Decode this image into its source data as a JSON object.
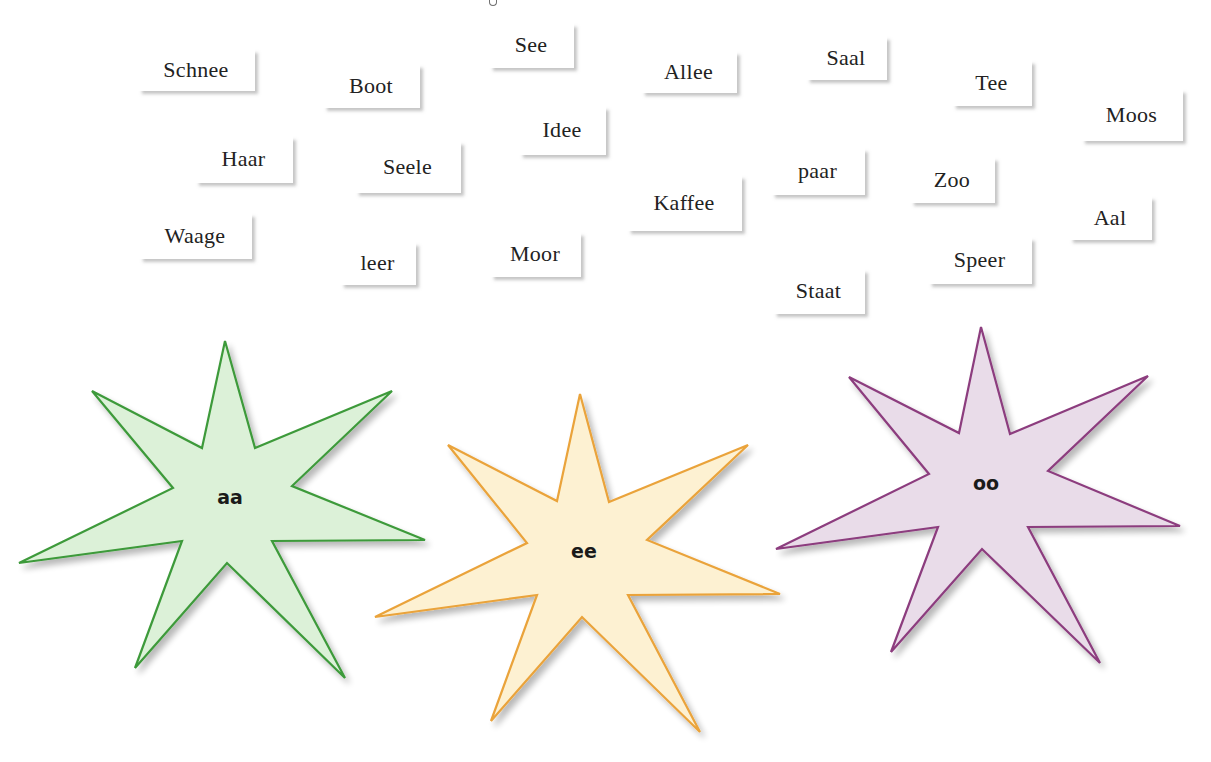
{
  "exercise": {
    "instruction_visible": false
  },
  "word_cards": [
    {
      "word": "Schnee",
      "x": 137,
      "y": 48,
      "w": 118,
      "h": 43
    },
    {
      "word": "Boot",
      "x": 322,
      "y": 63,
      "w": 98,
      "h": 45
    },
    {
      "word": "See",
      "x": 488,
      "y": 22,
      "w": 86,
      "h": 46
    },
    {
      "word": "Allee",
      "x": 640,
      "y": 50,
      "w": 97,
      "h": 43
    },
    {
      "word": "Saal",
      "x": 805,
      "y": 35,
      "w": 82,
      "h": 45
    },
    {
      "word": "Tee",
      "x": 951,
      "y": 59,
      "w": 81,
      "h": 47
    },
    {
      "word": "Moos",
      "x": 1080,
      "y": 88,
      "w": 103,
      "h": 53
    },
    {
      "word": "Haar",
      "x": 194,
      "y": 135,
      "w": 99,
      "h": 48
    },
    {
      "word": "Seele",
      "x": 354,
      "y": 140,
      "w": 107,
      "h": 53
    },
    {
      "word": "Idee",
      "x": 518,
      "y": 105,
      "w": 88,
      "h": 50
    },
    {
      "word": "paar",
      "x": 770,
      "y": 147,
      "w": 95,
      "h": 48
    },
    {
      "word": "Zoo",
      "x": 909,
      "y": 156,
      "w": 86,
      "h": 47
    },
    {
      "word": "Kaffee",
      "x": 626,
      "y": 174,
      "w": 116,
      "h": 57
    },
    {
      "word": "Aal",
      "x": 1068,
      "y": 195,
      "w": 84,
      "h": 45
    },
    {
      "word": "Waage",
      "x": 138,
      "y": 212,
      "w": 114,
      "h": 47
    },
    {
      "word": "leer",
      "x": 339,
      "y": 241,
      "w": 77,
      "h": 44
    },
    {
      "word": "Moor",
      "x": 489,
      "y": 231,
      "w": 92,
      "h": 46
    },
    {
      "word": "Speer",
      "x": 927,
      "y": 236,
      "w": 105,
      "h": 48
    },
    {
      "word": "Staat",
      "x": 772,
      "y": 268,
      "w": 93,
      "h": 46
    }
  ],
  "stars": [
    {
      "label": "aa",
      "fill": "#dcf1d8",
      "stroke": "#3e9a3a",
      "label_x": 230,
      "label_y": 498,
      "points": "225,341 255,448 392,391 292,486 425,540 272,541 345,678 227,563 135,668 182,541 19,563 173,488 92,391 202,448"
    },
    {
      "label": "ee",
      "fill": "#fdf1d2",
      "stroke": "#eaa33a",
      "label_x": 584,
      "label_y": 552,
      "points": "580,394 609,502 748,445 647,540 780,594 628,595 700,732 582,617 491,721 537,595 375,617 527,543 448,445 557,501"
    },
    {
      "label": "oo",
      "fill": "#e9dce9",
      "stroke": "#8c3c7e",
      "label_x": 986,
      "label_y": 484,
      "points": "981,327 1010,434 1148,376 1048,471 1180,526 1028,527 1100,663 982,549 891,652 938,527 776,549 929,474 849,377 959,433"
    }
  ]
}
